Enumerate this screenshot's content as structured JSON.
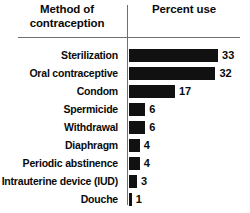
{
  "header": {
    "left_title": "Method of contraception",
    "right_title": "Percent use"
  },
  "chart_data": {
    "type": "bar",
    "orientation": "horizontal",
    "title": "",
    "xlabel": "Percent use",
    "ylabel": "Method of contraception",
    "grid": false,
    "legend": false,
    "xlim": [
      0,
      33
    ],
    "bar_color": "#111111",
    "rule_color": "#6f6f6f",
    "categories": [
      "Sterilization",
      "Oral contraceptive",
      "Condom",
      "Spermicide",
      "Withdrawal",
      "Diaphragm",
      "Periodic abstinence",
      "Intrauterine device (IUD)",
      "Douche"
    ],
    "values": [
      33,
      32,
      17,
      6,
      6,
      4,
      4,
      3,
      1
    ],
    "value_labels": [
      "33",
      "32",
      "17",
      "6",
      "6",
      "4",
      "4",
      "3",
      "1"
    ]
  }
}
